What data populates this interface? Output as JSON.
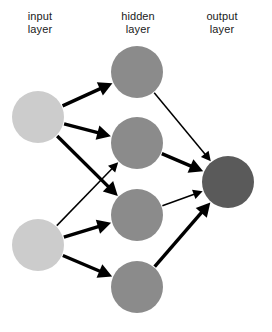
{
  "diagram": {
    "background_color": "#ffffff",
    "edge_color": "#000000",
    "labels": {
      "input": "input\nlayer",
      "hidden": "hidden\nlayer",
      "output": "output\nlayer"
    },
    "layers": [
      {
        "id": "input",
        "name": "input layer",
        "node_color": "#cccccc",
        "node_radius": 26,
        "nodes": [
          {
            "id": "i1",
            "cx": 38,
            "cy": 117
          },
          {
            "id": "i2",
            "cx": 38,
            "cy": 245
          }
        ]
      },
      {
        "id": "hidden",
        "name": "hidden layer",
        "node_color": "#8b8b8b",
        "node_radius": 26,
        "nodes": [
          {
            "id": "h1",
            "cx": 137,
            "cy": 72
          },
          {
            "id": "h2",
            "cx": 137,
            "cy": 143
          },
          {
            "id": "h3",
            "cx": 137,
            "cy": 215
          },
          {
            "id": "h4",
            "cx": 137,
            "cy": 287
          }
        ]
      },
      {
        "id": "output",
        "name": "output layer",
        "node_color": "#5a5a5a",
        "node_radius": 26,
        "nodes": [
          {
            "id": "o1",
            "cx": 228,
            "cy": 182
          }
        ]
      }
    ],
    "edges": [
      {
        "from": "i1",
        "to": "h1",
        "width": 3.4
      },
      {
        "from": "i1",
        "to": "h2",
        "width": 3.4
      },
      {
        "from": "i1",
        "to": "h3",
        "width": 3.4
      },
      {
        "from": "i2",
        "to": "h2",
        "width": 1.5
      },
      {
        "from": "i2",
        "to": "h3",
        "width": 3.4
      },
      {
        "from": "i2",
        "to": "h4",
        "width": 3.4
      },
      {
        "from": "h1",
        "to": "o1",
        "width": 1.5
      },
      {
        "from": "h2",
        "to": "o1",
        "width": 3.4
      },
      {
        "from": "h3",
        "to": "o1",
        "width": 1.5
      },
      {
        "from": "h4",
        "to": "o1",
        "width": 3.4
      }
    ]
  }
}
